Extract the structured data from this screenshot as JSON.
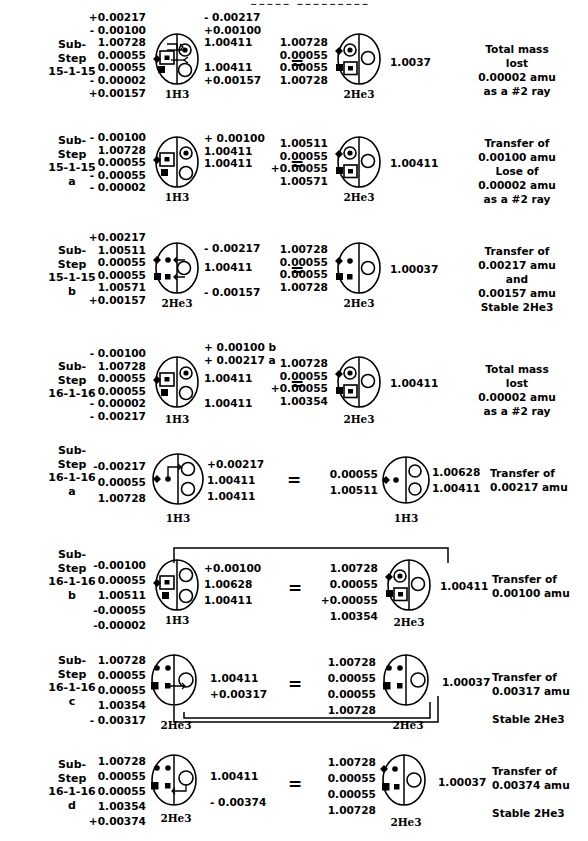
{
  "header": {
    "cropped_title": "▮▮▮▮▮  ▮▮▮▮▮▮▮▮▮"
  },
  "diagram": {
    "type": "nuclear-transmutation-substep-table",
    "left_isotope_label": "1H3",
    "helium_isotope_label": "2He3",
    "equals_symbol": "="
  },
  "rows": [
    {
      "id": "row-1",
      "step": {
        "line1": "Sub-",
        "line2": "Step",
        "line3": "15-1-15",
        "line4": ""
      },
      "left_nums": [
        "+0.00217",
        "- 0.00100",
        "1.00728",
        "0.00055",
        "- 0.00055",
        "- 0.00002",
        "+0.00157"
      ],
      "left_atom_label": "1H3",
      "left_atom_type": "h3-boxed",
      "mid_nums": [
        "- 0.00217",
        "+0.00100",
        "1.00411",
        "",
        "1.00411",
        "+0.00157"
      ],
      "right_nums": [
        "1.00728",
        "0.00055",
        "0.00055",
        "1.00728"
      ],
      "right_atom_label": "2He3",
      "right_atom_type": "he3-dot",
      "result": "1.0037",
      "note": [
        "Total mass",
        "lost",
        "0.00002 amu",
        "as a #2 ray"
      ]
    },
    {
      "id": "row-2",
      "step": {
        "line1": "Sub-",
        "line2": "Step",
        "line3": "15-1-15",
        "line4": "a"
      },
      "left_nums": [
        "- 0.00100",
        "1.00728",
        "0.00055",
        "- 0.00055",
        "- 0.00002"
      ],
      "left_atom_label": "1H3",
      "left_atom_type": "h3-boxed",
      "mid_nums": [
        "+ 0.00100",
        "1.00411",
        "1.00411"
      ],
      "right_nums": [
        "1.00511",
        "0.00055",
        "+0.00055",
        "1.00571"
      ],
      "right_atom_label": "2He3",
      "right_atom_type": "he3-dot",
      "result": "1.00411",
      "note": [
        "Transfer of",
        "0.00100 amu",
        "Lose of",
        "0.00002 amu",
        "as a #2 ray"
      ]
    },
    {
      "id": "row-3",
      "step": {
        "line1": "Sub-",
        "line2": "Step",
        "line3": "15-1-15",
        "line4": "b"
      },
      "left_nums": [
        "+0.00217",
        "1.00511",
        "0.00055",
        "0.00055",
        "1.00571",
        "+0.00157"
      ],
      "left_atom_label": "2He3",
      "left_atom_type": "he3-plain-arrow",
      "mid_nums": [
        "- 0.00217",
        "1.00411",
        "- 0.00157"
      ],
      "right_nums": [
        "1.00728",
        "0.00055",
        "0.00055",
        "1.00728"
      ],
      "right_atom_label": "2He3",
      "right_atom_type": "he3-plain",
      "result": "1.00037",
      "note": [
        "Transfer of",
        "0.00217 amu",
        "and",
        "0.00157 amu",
        "Stable 2He3"
      ]
    },
    {
      "id": "row-4",
      "step": {
        "line1": "Sub-",
        "line2": "Step",
        "line3": "16-1-16",
        "line4": ""
      },
      "left_nums": [
        "- 0.00100",
        "1.00728",
        "0.00055",
        "- 0.00055",
        "- 0.00002",
        "- 0.00217"
      ],
      "left_atom_label": "1H3",
      "left_atom_type": "h3-boxed",
      "mid_nums": [
        "+ 0.00100 b",
        "+ 0.00217 a",
        "1.00411",
        "1.00411"
      ],
      "right_nums": [
        "1.00728",
        "0.00055",
        "+0.00055",
        "1.00354"
      ],
      "right_atom_label": "2He3",
      "right_atom_type": "he3-dot",
      "result": "1.00411",
      "note": [
        "Total mass",
        "lost",
        "0.00002 amu",
        "as a #2 ray"
      ]
    },
    {
      "id": "row-5",
      "step": {
        "line1": "Sub-",
        "line2": "Step",
        "line3": "16-1-16",
        "line4": "a"
      },
      "left_nums": [
        "-0.00217",
        "0.00055",
        "1.00728"
      ],
      "left_atom_label": "1H3",
      "left_atom_type": "h3-open",
      "mid_nums": [
        "+0.00217",
        "1.00411",
        "1.00411"
      ],
      "right_nums": [
        "0.00055",
        "1.00511"
      ],
      "right_atom_label": "1H3",
      "right_atom_type": "h3-open-plain",
      "result": [
        "1.00628",
        "1.00411"
      ],
      "note": [
        "Transfer of",
        "0.00217 amu"
      ]
    },
    {
      "id": "row-6",
      "step": {
        "line1": "Sub-",
        "line2": "Step",
        "line3": "16-1-16",
        "line4": "b"
      },
      "left_nums": [
        "-0.00100",
        "0.00055",
        "1.00511",
        "-0.00055",
        "-0.00002"
      ],
      "left_atom_label": "1H3",
      "left_atom_type": "h3-boxed-open",
      "mid_nums": [
        "+0.00100",
        "1.00628",
        "1.00411"
      ],
      "right_nums": [
        "1.00728",
        "0.00055",
        "+0.00055",
        "1.00354"
      ],
      "right_atom_label": "2He3",
      "right_atom_type": "he3-dot",
      "result": "1.00411",
      "note": [
        "Transfer of",
        "0.00100 amu"
      ],
      "bridge": "top"
    },
    {
      "id": "row-7",
      "step": {
        "line1": "Sub-",
        "line2": "Step",
        "line3": "16-1-16",
        "line4": "c"
      },
      "left_nums": [
        "1.00728",
        "0.00055",
        "0.00055",
        "1.00354",
        "- 0.00317"
      ],
      "left_atom_label": "2He3",
      "left_atom_type": "he3-arrow-right",
      "mid_nums": [
        "1.00411",
        "+0.00317"
      ],
      "right_nums": [
        "1.00728",
        "0.00055",
        "0.00055",
        "1.00728"
      ],
      "right_atom_label": "2He3",
      "right_atom_type": "he3-plain",
      "result": "1.00037",
      "note": [
        "Transfer of",
        "0.00317 amu",
        "",
        "Stable 2He3"
      ],
      "bridge": "bottom"
    },
    {
      "id": "row-8",
      "step": {
        "line1": "Sub-",
        "line2": "Step",
        "line3": "16-1-16",
        "line4": "d"
      },
      "left_nums": [
        "1.00728",
        "0.00055",
        "0.00055",
        "1.00354",
        "+0.00374"
      ],
      "left_atom_label": "2He3",
      "left_atom_type": "he3-arrow-back",
      "mid_nums": [
        "1.00411",
        "- 0.00374"
      ],
      "right_nums": [
        "1.00728",
        "0.00055",
        "0.00055",
        "1.00728"
      ],
      "right_atom_label": "2He3",
      "right_atom_type": "he3-plain",
      "result": "1.00037",
      "note": [
        "Transfer of",
        "0.00374 amu",
        "",
        "Stable 2He3"
      ]
    }
  ]
}
